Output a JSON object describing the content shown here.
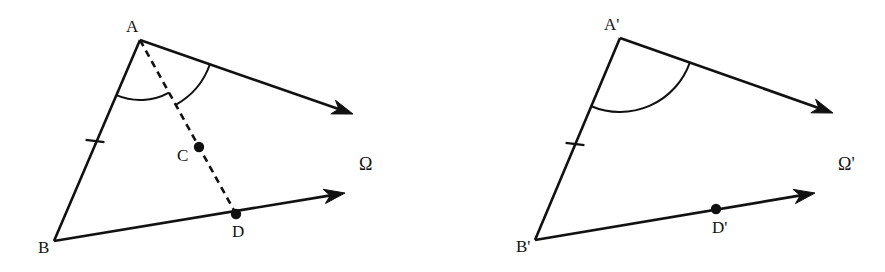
{
  "figure": {
    "background_color": "#ffffff",
    "stroke_color": "#111111",
    "width": 885,
    "height": 272
  },
  "left_figure": {
    "name": "figure-omega",
    "region_label": "Ω",
    "region_label_pos": {
      "x": 359,
      "y": 155
    },
    "vertices": {
      "A": {
        "label": "A",
        "x": 140,
        "y": 40,
        "label_x": 126,
        "label_y": 18
      },
      "B": {
        "label": "B",
        "x": 54,
        "y": 241,
        "label_x": 38,
        "label_y": 239
      },
      "C": {
        "label": "C",
        "x": 199,
        "y": 147,
        "label_x": 177,
        "label_y": 147
      },
      "D": {
        "label": "D",
        "x": 236,
        "y": 214,
        "label_x": 232,
        "label_y": 223
      }
    },
    "rays": [
      {
        "name": "ray-A-upper",
        "from": "A",
        "tip_x": 353,
        "tip_y": 114
      },
      {
        "name": "ray-B-lower",
        "from": "B",
        "tip_x": 345,
        "tip_y": 193
      }
    ],
    "segments": [
      {
        "name": "segment-AB",
        "x1": 140,
        "y1": 40,
        "x2": 54,
        "y2": 241,
        "style": "solid"
      }
    ],
    "dashed_segments": [
      {
        "name": "dashed-segment-AD",
        "x1": 140,
        "y1": 40,
        "x2": 236,
        "y2": 214
      }
    ],
    "tick_marks": [
      {
        "name": "tick-mark-AB",
        "x": 95,
        "y": 141
      }
    ],
    "marked_points": [
      {
        "name": "point-C",
        "x": 199,
        "y": 147,
        "r": 5.2
      },
      {
        "name": "point-D",
        "x": 236,
        "y": 214,
        "r": 5.2
      }
    ],
    "angle_arcs": [
      {
        "name": "angle-arc-BAC-inner",
        "radius": 60
      },
      {
        "name": "angle-arc-CAray-outer",
        "radius": 74
      }
    ]
  },
  "right_figure": {
    "name": "figure-omega-prime",
    "region_label": "Ω'",
    "region_label_pos": {
      "x": 838,
      "y": 155
    },
    "vertices": {
      "A": {
        "label": "A'",
        "x": 620,
        "y": 38,
        "label_x": 604,
        "label_y": 16
      },
      "B": {
        "label": "B'",
        "x": 535,
        "y": 240,
        "label_x": 516,
        "label_y": 238
      },
      "D": {
        "label": "D'",
        "x": 716,
        "y": 209,
        "label_x": 712,
        "label_y": 219
      }
    },
    "rays": [
      {
        "name": "ray-Aprime-upper",
        "from": "A",
        "tip_x": 833,
        "tip_y": 113
      },
      {
        "name": "ray-Bprime-lower",
        "from": "B",
        "tip_x": 815,
        "tip_y": 193
      }
    ],
    "segments": [
      {
        "name": "segment-AprimeBprime",
        "x1": 620,
        "y1": 38,
        "x2": 535,
        "y2": 240,
        "style": "solid"
      }
    ],
    "tick_marks": [
      {
        "name": "tick-mark-AprimeBprime",
        "x": 575,
        "y": 144
      }
    ],
    "marked_points": [
      {
        "name": "point-Dprime",
        "x": 716,
        "y": 209,
        "r": 5.2
      }
    ],
    "angle_arcs": [
      {
        "name": "angle-arc-Aprime-outer",
        "radius": 74
      }
    ]
  }
}
